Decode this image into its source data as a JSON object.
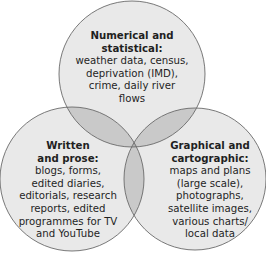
{
  "diagram": {
    "type": "venn",
    "colors": {
      "circle_fill": "#e9e9e9",
      "pair_overlap_fill": "#c9c9c9",
      "center_overlap_fill": "#b1b1b1",
      "stroke": "#6a6a6a",
      "text": "#1f1f1f"
    },
    "sets": [
      {
        "id": "numerical",
        "title": "Numerical and statistical:",
        "title_lines": [
          "Numerical and",
          "statistical:"
        ],
        "items_text": "weather data, census, deprivation (IMD), crime, daily river flows",
        "items_lines": [
          "weather data, census,",
          "deprivation (IMD),",
          "crime, daily river",
          "flows"
        ]
      },
      {
        "id": "written",
        "title": "Written and prose:",
        "title_lines": [
          "Written",
          "and prose:"
        ],
        "items_text": "blogs, forms, edited diaries, editorials, research reports, edited programmes for TV and YouTube",
        "items_lines": [
          "blogs, forms,",
          "edited diaries,",
          "editorials, research",
          "reports, edited",
          "programmes for TV",
          "and YouTube"
        ]
      },
      {
        "id": "graphical",
        "title": "Graphical and cartographic:",
        "title_lines": [
          "Graphical and",
          "cartographic:"
        ],
        "items_text": "maps and plans (large scale), photographs, satellite images, various charts/ local data",
        "items_lines": [
          "maps and plans",
          "(large scale),",
          "photographs,",
          "satellite images,",
          "various charts/",
          "local data"
        ]
      }
    ]
  }
}
